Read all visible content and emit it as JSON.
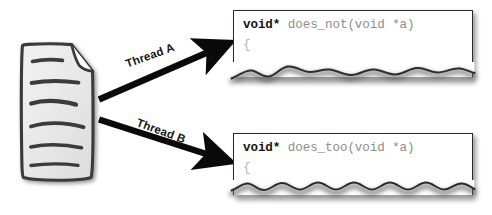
{
  "diagram": {
    "background_color": "#ffffff",
    "main_program": {
      "label": "Main program",
      "icon": "document-sketch-icon",
      "line_count": 6
    },
    "arrows": [
      {
        "id": "thread-a",
        "label": "Thread A",
        "direction": "up-right",
        "rotation_deg": -20
      },
      {
        "id": "thread-b",
        "label": "Thread B",
        "direction": "down-right",
        "rotation_deg": 20
      }
    ],
    "code_boxes": [
      {
        "id": "does-not",
        "keyword": "void*",
        "signature": " does_not(void *a)",
        "body_open_brace": "{",
        "torn_bottom_edge": true,
        "text_color": "#8d8d8d",
        "keyword_color": "#151515"
      },
      {
        "id": "does-too",
        "keyword": "void*",
        "signature": " does_too(void *a)",
        "body_open_brace": "{",
        "torn_bottom_edge": true,
        "text_color": "#8d8d8d",
        "keyword_color": "#151515"
      }
    ],
    "colors": {
      "ink": "#2a2a2a",
      "arrow": "#0a0a0a",
      "label": "#161616",
      "code_gray": "#8d8d8d",
      "paper": "#ffffff"
    }
  }
}
